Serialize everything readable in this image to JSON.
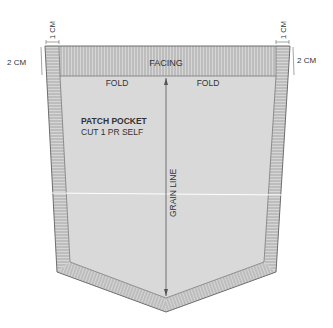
{
  "diagram": {
    "type": "sewing-pattern",
    "piece_name": "PATCH POCKET",
    "cut_instruction": "CUT 1 PR SELF",
    "labels": {
      "facing": "FACING",
      "fold_left": "FOLD",
      "fold_right": "FOLD",
      "grain_line": "GRAIN LINE"
    },
    "dimensions": {
      "top_left_width": "1 CM",
      "top_left_height": "2 CM",
      "top_right_width": "1 CM",
      "top_right_height": "2 CM"
    },
    "colors": {
      "fill": "#d9d9d9",
      "seam_allowance": "#cfcfcf",
      "hatch": "#8a8a8a",
      "outline": "#6e6e6e",
      "text": "#333333"
    }
  }
}
